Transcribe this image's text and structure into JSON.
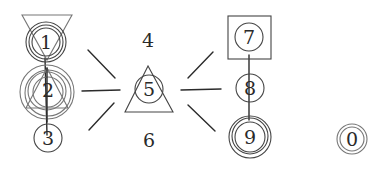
{
  "diagram": {
    "type": "hand-drawn node diagram",
    "nodes": [
      {
        "id": "1",
        "label": "1",
        "shape": "triple-circle with inverted triangle"
      },
      {
        "id": "2",
        "label": "2",
        "shape": "quadruple-circle with triangle"
      },
      {
        "id": "3",
        "label": "3",
        "shape": "circle"
      },
      {
        "id": "4",
        "label": "4",
        "shape": "text only"
      },
      {
        "id": "5",
        "label": "5",
        "shape": "circle inside triangle"
      },
      {
        "id": "6",
        "label": "6",
        "shape": "text only"
      },
      {
        "id": "7",
        "label": "7",
        "shape": "circle inside square"
      },
      {
        "id": "8",
        "label": "8",
        "shape": "circle"
      },
      {
        "id": "9",
        "label": "9",
        "shape": "triple-circle"
      },
      {
        "id": "0",
        "label": "0",
        "shape": "double-circle"
      }
    ],
    "edges": [
      {
        "from": "1",
        "to": "2"
      },
      {
        "from": "2",
        "to": "3"
      },
      {
        "from": "7",
        "to": "8"
      },
      {
        "from": "8",
        "to": "9"
      }
    ],
    "rays": {
      "left_of_5": 3,
      "right_of_5": 3
    },
    "colors": {
      "stroke": "#2b2b2b",
      "background": "#ffffff"
    }
  }
}
